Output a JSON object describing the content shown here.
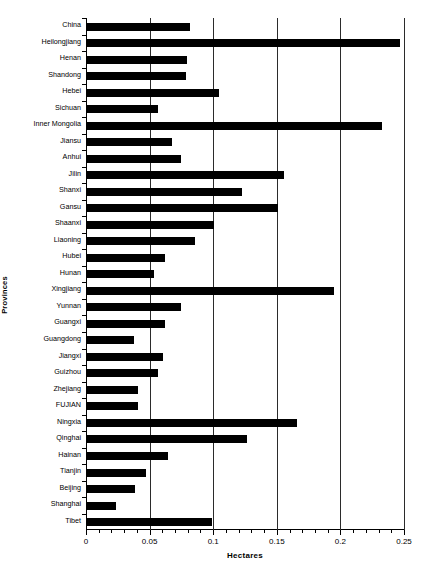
{
  "chart_data": {
    "type": "bar",
    "orientation": "horizontal",
    "title": "",
    "xlabel": "Hectares",
    "ylabel": "Provinces",
    "xlim": [
      0,
      0.25
    ],
    "xticks": [
      0,
      0.05,
      0.1,
      0.15,
      0.2,
      0.25
    ],
    "xtick_labels": [
      "0",
      "0.05",
      "0.1",
      "0.15",
      "0.2",
      "0.25"
    ],
    "minor_tick_step": 0.01,
    "grid": "vertical-major",
    "legend": "none",
    "bar_color": "#000000",
    "categories": [
      "China",
      "Heilongjiang",
      "Henan",
      "Shandong",
      "Hebei",
      "Sichuan",
      "Inner Mongolia",
      "Jiansu",
      "Anhui",
      "Jilin",
      "Shanxi",
      "Gansu",
      "Shaanxi",
      "Liaoning",
      "Hubei",
      "Hunan",
      "Xingjiang",
      "Yunnan",
      "Guangxi",
      "Guangdong",
      "Jiangxi",
      "Guizhou",
      "Zhejiang",
      "FUJIAN",
      "Ningxia",
      "Qinghai",
      "Hainan",
      "Tianjin",
      "Beijing",
      "Shanghai",
      "Tibet"
    ],
    "values": [
      0.081,
      0.246,
      0.079,
      0.078,
      0.104,
      0.056,
      0.232,
      0.067,
      0.074,
      0.155,
      0.122,
      0.15,
      0.1,
      0.085,
      0.061,
      0.053,
      0.194,
      0.074,
      0.061,
      0.037,
      0.06,
      0.056,
      0.04,
      0.04,
      0.165,
      0.126,
      0.064,
      0.046,
      0.038,
      0.023,
      0.098
    ]
  }
}
